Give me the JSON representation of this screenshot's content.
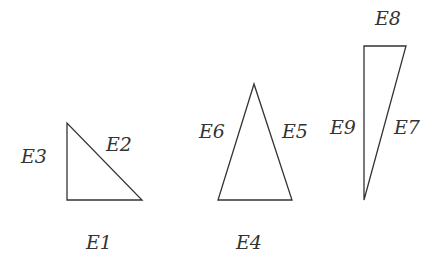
{
  "diagram": {
    "shapes": [
      {
        "name": "right-triangle",
        "points": [
          [
            67,
            123
          ],
          [
            67,
            200
          ],
          [
            142,
            200
          ]
        ],
        "labels": [
          {
            "text": "E1",
            "x": 86,
            "y": 249
          },
          {
            "text": "E2",
            "x": 106,
            "y": 151
          },
          {
            "text": "E3",
            "x": 21,
            "y": 163
          }
        ]
      },
      {
        "name": "isosceles-triangle",
        "points": [
          [
            254,
            84
          ],
          [
            218,
            200
          ],
          [
            292,
            200
          ]
        ],
        "labels": [
          {
            "text": "E4",
            "x": 236,
            "y": 249
          },
          {
            "text": "E5",
            "x": 282,
            "y": 138
          },
          {
            "text": "E6",
            "x": 199,
            "y": 138
          }
        ]
      },
      {
        "name": "tall-right-triangle",
        "points": [
          [
            364,
            46
          ],
          [
            406,
            46
          ],
          [
            364,
            200
          ]
        ],
        "labels": [
          {
            "text": "E7",
            "x": 394,
            "y": 134
          },
          {
            "text": "E8",
            "x": 375,
            "y": 25
          },
          {
            "text": "E9",
            "x": 330,
            "y": 134
          }
        ]
      }
    ],
    "stroke_color": "#333333"
  }
}
